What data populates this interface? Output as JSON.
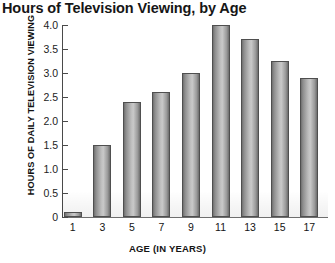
{
  "chart_data": {
    "type": "bar",
    "title": "Hours of Television Viewing, by Age",
    "xlabel": "AGE (IN YEARS)",
    "ylabel": "HOURS OF DAILY TELEVISION VIEWING",
    "categories": [
      "1",
      "3",
      "5",
      "7",
      "9",
      "11",
      "13",
      "15",
      "17"
    ],
    "values": [
      0.1,
      1.5,
      2.4,
      2.6,
      3.0,
      4.0,
      3.7,
      3.25,
      2.9
    ],
    "ylim": [
      0,
      4.0
    ],
    "ytick_labels": [
      "4.0",
      "3.5",
      "3.0",
      "2.5",
      "2.0",
      "1.5",
      "1.0",
      "0.5",
      "0"
    ],
    "ytick_values": [
      4.0,
      3.5,
      3.0,
      2.5,
      2.0,
      1.5,
      1.0,
      0.5,
      0
    ],
    "grid": false,
    "legend": "none",
    "bar_color": "#b0b0b0",
    "bar_edge_color": "#4f4f4f",
    "axis_color": "#4a4a4a",
    "background": "#ffffff"
  }
}
